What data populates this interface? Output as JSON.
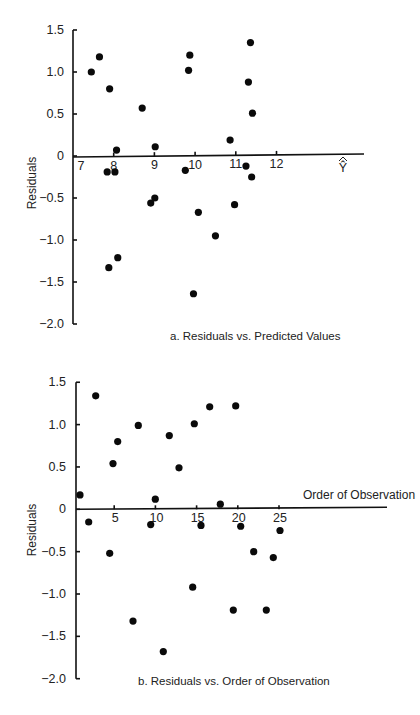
{
  "chart_data": [
    {
      "type": "scatter",
      "panel": "a",
      "title": "a.  Residuals vs. Predicted Values",
      "xlabel": "Ŷ",
      "ylabel": "Residuals",
      "xlim": [
        7,
        12
      ],
      "ylim": [
        -2.0,
        1.5
      ],
      "x_ticks": [
        "7",
        "8",
        "9",
        "10",
        "11",
        "12"
      ],
      "y_ticks": [
        "1.5",
        "1.0",
        "0.5",
        "0",
        "-0.5",
        "-1.0",
        "-1.5",
        "-2.0"
      ],
      "grid": false,
      "points": [
        {
          "x": 7.45,
          "y": 1.0
        },
        {
          "x": 7.65,
          "y": 1.18
        },
        {
          "x": 7.9,
          "y": 0.8
        },
        {
          "x": 8.7,
          "y": 0.57
        },
        {
          "x": 8.07,
          "y": 0.07
        },
        {
          "x": 9.02,
          "y": 0.11
        },
        {
          "x": 9.84,
          "y": 1.02
        },
        {
          "x": 9.87,
          "y": 1.2
        },
        {
          "x": 11.36,
          "y": 1.35
        },
        {
          "x": 11.31,
          "y": 0.88
        },
        {
          "x": 11.41,
          "y": 0.51
        },
        {
          "x": 10.86,
          "y": 0.19
        },
        {
          "x": 7.84,
          "y": -0.19
        },
        {
          "x": 8.03,
          "y": -0.19
        },
        {
          "x": 9.76,
          "y": -0.17
        },
        {
          "x": 11.25,
          "y": -0.12
        },
        {
          "x": 11.39,
          "y": -0.25
        },
        {
          "x": 8.91,
          "y": -0.56
        },
        {
          "x": 9.01,
          "y": -0.5
        },
        {
          "x": 10.08,
          "y": -0.67
        },
        {
          "x": 10.97,
          "y": -0.58
        },
        {
          "x": 10.5,
          "y": -0.95
        },
        {
          "x": 7.88,
          "y": -1.33
        },
        {
          "x": 8.1,
          "y": -1.21
        },
        {
          "x": 9.96,
          "y": -1.64
        }
      ]
    },
    {
      "type": "scatter",
      "panel": "b",
      "title": "b.  Residuals vs. Order of Observation",
      "xlabel": "Order of Observation",
      "ylabel": "Residuals",
      "xlim": [
        0,
        38
      ],
      "ylim": [
        -2.0,
        1.5
      ],
      "x_ticks": [
        "5",
        "10",
        "15",
        "20",
        "25"
      ],
      "y_ticks": [
        "1.5",
        "1.0",
        "0.5",
        "0",
        "-0.5",
        "-1.0",
        "-1.5",
        "-2.0"
      ],
      "grid": false,
      "points": [
        {
          "x": 1,
          "y": 0.17
        },
        {
          "x": 2,
          "y": -0.15
        },
        {
          "x": 3,
          "y": 1.34
        },
        {
          "x": 4,
          "y": -0.52
        },
        {
          "x": 5,
          "y": 0.54
        },
        {
          "x": 6,
          "y": 0.8
        },
        {
          "x": 7,
          "y": -1.32
        },
        {
          "x": 8,
          "y": 0.99
        },
        {
          "x": 9,
          "y": -0.18
        },
        {
          "x": 10,
          "y": 0.12
        },
        {
          "x": 11,
          "y": -1.68
        },
        {
          "x": 12,
          "y": 0.87
        },
        {
          "x": 13,
          "y": 0.49
        },
        {
          "x": 14,
          "y": -0.92
        },
        {
          "x": 15,
          "y": 1.01
        },
        {
          "x": 16,
          "y": -0.19
        },
        {
          "x": 17,
          "y": 1.21
        },
        {
          "x": 18,
          "y": 0.06
        },
        {
          "x": 19,
          "y": -1.19
        },
        {
          "x": 20,
          "y": 1.22
        },
        {
          "x": 21,
          "y": -0.2
        },
        {
          "x": 22,
          "y": -0.5
        },
        {
          "x": 23,
          "y": -1.19
        },
        {
          "x": 24,
          "y": -0.57
        },
        {
          "x": 25,
          "y": -0.25
        }
      ],
      "point_px_x": [
        80,
        88.7,
        95.7,
        109.7,
        113,
        117.7,
        133,
        138.3,
        150.7,
        155.3,
        163.3,
        169.3,
        179,
        192.7,
        194.3,
        201,
        209.7,
        220.3,
        233.3,
        235.7,
        240.7,
        253.7,
        266.3,
        273.3,
        280
      ]
    }
  ]
}
